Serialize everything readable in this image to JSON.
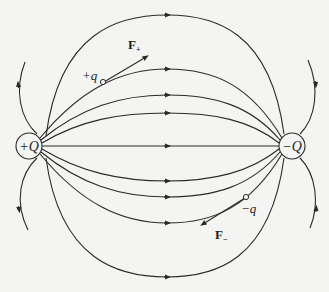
{
  "diagram": {
    "colors": {
      "line": "#2a2a2a",
      "background": "#f4f4f2",
      "text": "#1e1e1e"
    },
    "charges": [
      {
        "id": "positive-source",
        "label": "+Q",
        "cx": 29,
        "cy": 146,
        "r": 13
      },
      {
        "id": "negative-source",
        "label": "−Q",
        "cx": 292,
        "cy": 146,
        "r": 13
      }
    ],
    "test_charges": [
      {
        "id": "positive-test",
        "label": "+q",
        "x": 103,
        "y": 82
      },
      {
        "id": "negative-test",
        "label": "−q",
        "x": 246,
        "y": 197
      }
    ],
    "forces": [
      {
        "id": "force-positive",
        "label": "F",
        "subscript": "+",
        "direction": "along field (away from +Q)"
      },
      {
        "id": "force-negative",
        "label": "F",
        "subscript": "−",
        "direction": "against field (toward +Q)"
      }
    ],
    "field_lines_count": 13
  }
}
